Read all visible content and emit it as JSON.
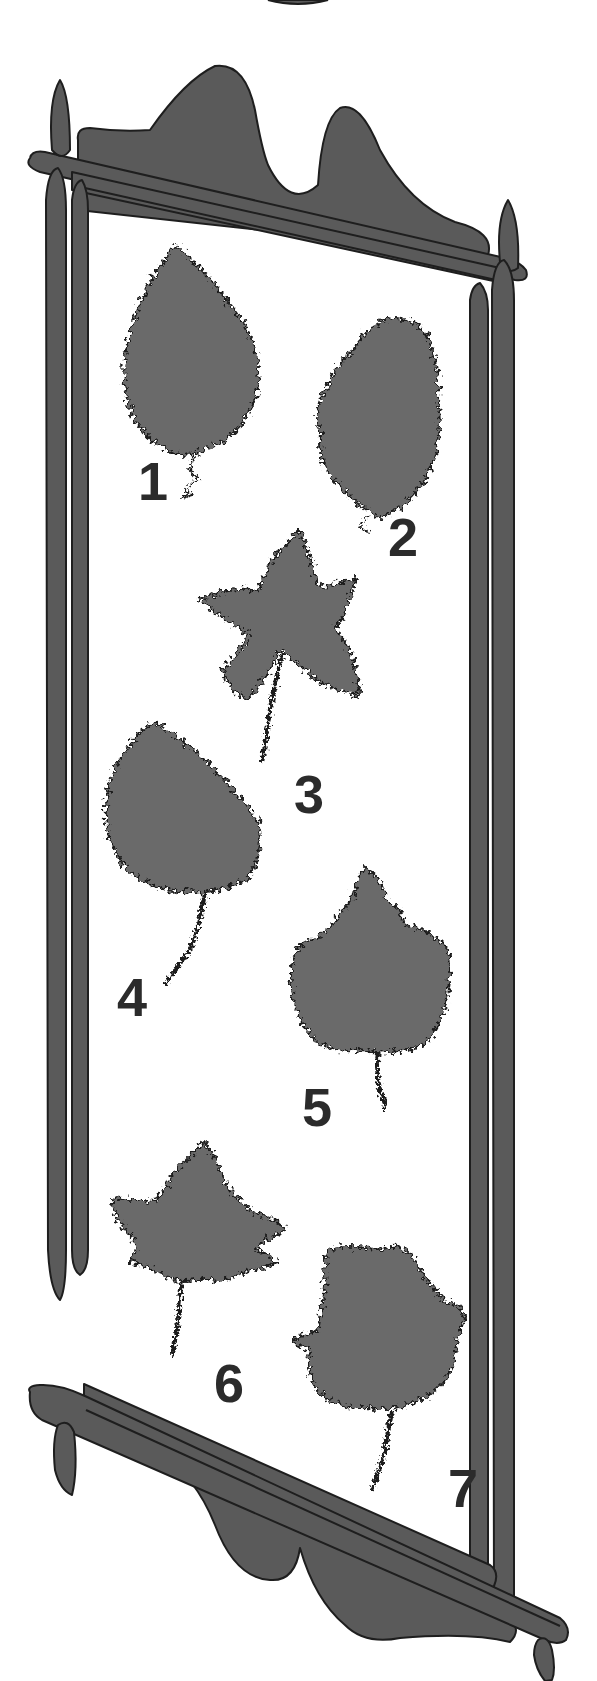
{
  "illustration": {
    "subject": "decorative hanging frame displaying seven numbered leaf silhouettes",
    "colors": {
      "background": "#ffffff",
      "frame_fill": "#5a5a5a",
      "leaf_fill": "#6b6b6b",
      "outline": "#1e1e1e",
      "number_fill": "#2b2b2b"
    },
    "leaves": [
      {
        "label": "1",
        "shape": "ovate serrated leaf"
      },
      {
        "label": "2",
        "shape": "lobed oak-like leaf"
      },
      {
        "label": "3",
        "shape": "five-pointed star-shaped leaf"
      },
      {
        "label": "4",
        "shape": "rounded heart-shaped leaf"
      },
      {
        "label": "5",
        "shape": "broad lobed leaf with pointed tip"
      },
      {
        "label": "6",
        "shape": "maple-like palmate leaf"
      },
      {
        "label": "7",
        "shape": "broad irregular lobed leaf"
      }
    ]
  }
}
